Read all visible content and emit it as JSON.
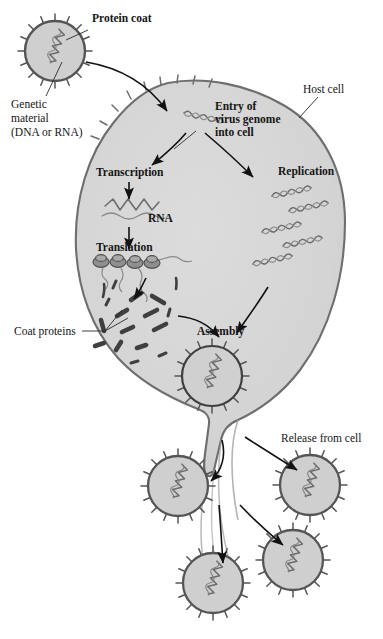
{
  "diagram": {
    "colors": {
      "cell_fill": "#d3d3d3",
      "cell_stroke": "#6e6e6e",
      "virus_fill": "#cfcfcf",
      "virus_stroke": "#555555",
      "genome_stroke": "#6b6b6b",
      "protein_fill": "#4a4a4a",
      "arrow": "#111111",
      "text": "#151515",
      "background": "#ffffff"
    },
    "labels": {
      "protein_coat": "Protein coat",
      "genetic_material_l1": "Genetic",
      "genetic_material_l2": "material",
      "genetic_material_l3": "(DNA or RNA)",
      "host_cell": "Host cell",
      "entry_l1": "Entry of",
      "entry_l2": "virus genome",
      "entry_l3": "into cell",
      "transcription": "Transcription",
      "replication": "Replication",
      "rna": "RNA",
      "translation": "Translation",
      "coat_proteins": "Coat proteins",
      "assembly": "Assembly",
      "release": "Release from cell"
    },
    "stages": [
      "Protein coat",
      "Genetic material (DNA or RNA)",
      "Entry of virus genome into cell",
      "Transcription",
      "Replication",
      "RNA",
      "Translation",
      "Coat proteins",
      "Assembly",
      "Release from cell"
    ],
    "counts": {
      "free_virus_top": 1,
      "ribosomes": 4,
      "replicated_genomes": 5,
      "assembled_virus_in_cell": 1,
      "released_viruses": 4,
      "virus_spikes": 16
    }
  }
}
